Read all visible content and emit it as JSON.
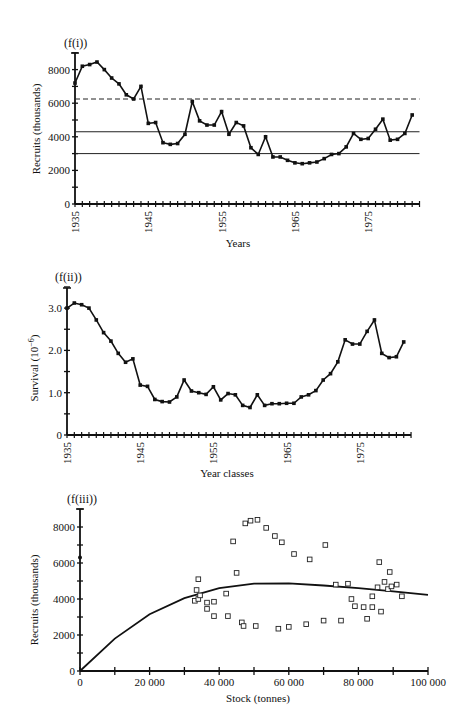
{
  "chart_data": [
    {
      "panel": "(f(i))",
      "type": "line",
      "title": "(f(i))",
      "xlabel": "Years",
      "ylabel": "Recruits (thousands)",
      "xlim": [
        1935,
        1982
      ],
      "ylim": [
        0,
        9000
      ],
      "x_ticks": [
        "1935",
        "1945",
        "1955",
        "1965",
        "1975"
      ],
      "y_ticks": [
        "0",
        "2000",
        "4000",
        "6000",
        "8000"
      ],
      "grid": false,
      "reference_lines": [
        {
          "style": "dashed",
          "y": 6250
        },
        {
          "style": "solid",
          "y": 4300
        },
        {
          "style": "solid",
          "y": 3000
        }
      ],
      "x": [
        1935,
        1936,
        1937,
        1938,
        1939,
        1940,
        1941,
        1942,
        1943,
        1944,
        1945,
        1946,
        1947,
        1948,
        1949,
        1950,
        1951,
        1952,
        1953,
        1954,
        1955,
        1956,
        1957,
        1958,
        1959,
        1960,
        1961,
        1962,
        1963,
        1964,
        1965,
        1966,
        1967,
        1968,
        1969,
        1970,
        1971,
        1972,
        1973,
        1974,
        1975,
        1976,
        1977,
        1978,
        1979,
        1980,
        1981,
        1982
      ],
      "values": [
        7200,
        8200,
        8300,
        8450,
        8000,
        7500,
        7150,
        6500,
        6250,
        7000,
        4800,
        4850,
        3650,
        3550,
        3600,
        4150,
        6100,
        4950,
        4700,
        4700,
        5500,
        4150,
        4850,
        4650,
        3350,
        2950,
        4000,
        2800,
        2800,
        2600,
        2450,
        2400,
        2450,
        2500,
        2700,
        2950,
        3000,
        3400,
        4200,
        3850,
        3900,
        4450,
        5050,
        3800,
        3850,
        4200,
        5300
      ]
    },
    {
      "panel": "(f(ii))",
      "type": "line",
      "title": "(f(ii))",
      "xlabel": "Year classes",
      "ylabel": "Survival (10^-6)",
      "xlim": [
        1935,
        1982
      ],
      "ylim": [
        0,
        3.5
      ],
      "x_ticks": [
        "1935",
        "1945",
        "1955",
        "1965",
        "1975"
      ],
      "y_ticks": [
        "0",
        "1.0",
        "2.0",
        "3.0"
      ],
      "grid": false,
      "x": [
        1935,
        1936,
        1937,
        1938,
        1939,
        1940,
        1941,
        1942,
        1943,
        1944,
        1945,
        1946,
        1947,
        1948,
        1949,
        1950,
        1951,
        1952,
        1953,
        1954,
        1955,
        1956,
        1957,
        1958,
        1959,
        1960,
        1961,
        1962,
        1963,
        1964,
        1965,
        1966,
        1967,
        1968,
        1969,
        1970,
        1971,
        1972,
        1973,
        1974,
        1975,
        1976,
        1977,
        1978,
        1979,
        1980
      ],
      "values": [
        3.0,
        3.12,
        3.08,
        3.0,
        2.72,
        2.42,
        2.22,
        1.93,
        1.72,
        1.8,
        1.18,
        1.15,
        0.84,
        0.79,
        0.78,
        0.9,
        1.3,
        1.04,
        1.0,
        0.96,
        1.14,
        0.83,
        0.98,
        0.95,
        0.7,
        0.65,
        0.95,
        0.7,
        0.74,
        0.74,
        0.75,
        0.75,
        0.9,
        0.95,
        1.05,
        1.3,
        1.45,
        1.73,
        2.25,
        2.15,
        2.15,
        2.45,
        2.72,
        1.93,
        1.83,
        1.85,
        2.2
      ]
    },
    {
      "panel": "(f(iii))",
      "type": "scatter",
      "title": "(f(iii))",
      "xlabel": "Stock (tonnes)",
      "ylabel": "Recruits (thousands)",
      "xlim": [
        0,
        100000
      ],
      "ylim": [
        0,
        9000
      ],
      "x_ticks": [
        "0",
        "20 000",
        "40 000",
        "60 000",
        "80 000",
        "100 000"
      ],
      "y_ticks": [
        "0",
        "2000",
        "4000",
        "6000",
        "8000"
      ],
      "grid": false,
      "fitted_curve": {
        "type": "line",
        "x": [
          0,
          10000,
          20000,
          30000,
          40000,
          50000,
          60000,
          70000,
          80000,
          90000,
          100000
        ],
        "values": [
          0,
          1800,
          3150,
          4050,
          4600,
          4850,
          4870,
          4750,
          4600,
          4420,
          4230
        ]
      },
      "origin_point": {
        "x": 0,
        "y": 6300
      },
      "points": [
        {
          "x": 33000,
          "y": 3900
        },
        {
          "x": 33500,
          "y": 4500
        },
        {
          "x": 34000,
          "y": 5100
        },
        {
          "x": 34000,
          "y": 4000
        },
        {
          "x": 34500,
          "y": 4200
        },
        {
          "x": 36500,
          "y": 3450
        },
        {
          "x": 36500,
          "y": 3800
        },
        {
          "x": 38500,
          "y": 3050
        },
        {
          "x": 38500,
          "y": 3850
        },
        {
          "x": 42000,
          "y": 4300
        },
        {
          "x": 42500,
          "y": 3050
        },
        {
          "x": 44000,
          "y": 7200
        },
        {
          "x": 45000,
          "y": 5450
        },
        {
          "x": 46500,
          "y": 2700
        },
        {
          "x": 47500,
          "y": 8200
        },
        {
          "x": 47000,
          "y": 2500
        },
        {
          "x": 49000,
          "y": 8350
        },
        {
          "x": 50500,
          "y": 2500
        },
        {
          "x": 51000,
          "y": 8400
        },
        {
          "x": 53500,
          "y": 7950
        },
        {
          "x": 56000,
          "y": 7500
        },
        {
          "x": 57000,
          "y": 2350
        },
        {
          "x": 58000,
          "y": 7150
        },
        {
          "x": 60000,
          "y": 2450
        },
        {
          "x": 61500,
          "y": 6500
        },
        {
          "x": 65000,
          "y": 2600
        },
        {
          "x": 66000,
          "y": 6200
        },
        {
          "x": 70000,
          "y": 2800
        },
        {
          "x": 70500,
          "y": 7000
        },
        {
          "x": 73500,
          "y": 4800
        },
        {
          "x": 75000,
          "y": 2800
        },
        {
          "x": 77000,
          "y": 4850
        },
        {
          "x": 78000,
          "y": 4000
        },
        {
          "x": 79000,
          "y": 3600
        },
        {
          "x": 81500,
          "y": 3550
        },
        {
          "x": 82500,
          "y": 2900
        },
        {
          "x": 84000,
          "y": 4150
        },
        {
          "x": 84000,
          "y": 3550
        },
        {
          "x": 85500,
          "y": 4650
        },
        {
          "x": 86000,
          "y": 6050
        },
        {
          "x": 86500,
          "y": 3300
        },
        {
          "x": 87500,
          "y": 4950
        },
        {
          "x": 88500,
          "y": 4550
        },
        {
          "x": 89000,
          "y": 5500
        },
        {
          "x": 89500,
          "y": 4700
        },
        {
          "x": 91000,
          "y": 4800
        },
        {
          "x": 92500,
          "y": 4150
        }
      ]
    }
  ],
  "labels": {
    "p1_title": "(f(i))",
    "p1_xlabel": "Years",
    "p1_ylabel": "Recruits (thousands)",
    "p2_title": "(f(ii))",
    "p2_xlabel": "Year classes",
    "p2_ylabel": "Survival (10",
    "p2_ylabel_sup": "−6",
    "p2_ylabel_end": ")",
    "p3_title": "(f(iii))",
    "p3_xlabel": "Stock (tonnes)",
    "p3_ylabel": "Recruits (thousands)"
  }
}
